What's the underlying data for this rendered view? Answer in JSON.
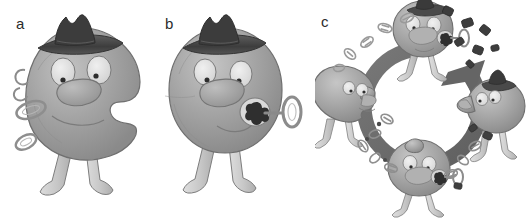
{
  "figure": {
    "background_color": "#ffffff",
    "type": "three-panel cartoon illustration",
    "panels": [
      {
        "id": "a",
        "label": "a",
        "description": "Cartoon blob character wearing a dark fedora hat, with a bite-shaped notch missing from its right side and detached ring and hook fragments floating beside it on the left",
        "character": {
          "has_hat": true,
          "hat_color": "#4a4a4a",
          "body_color": "#9a9a9a",
          "eyes": 2,
          "legs": 2,
          "notch": "right side concave cut",
          "key_attached": false
        },
        "detached_pieces": [
          "hook",
          "ring-large",
          "ring-small"
        ]
      },
      {
        "id": "b",
        "label": "b",
        "description": "Cartoon blob character wearing a dark fedora hat, intact round body with a key-and-ring inserted into a dark keyhole on its right side",
        "character": {
          "has_hat": true,
          "hat_color": "#4a4a4a",
          "body_color": "#9a9a9a",
          "eyes": 2,
          "legs": 2,
          "notch": "none",
          "key_attached": true
        },
        "detached_pieces": []
      },
      {
        "id": "c",
        "label": "c",
        "description": "Cyclic diagram: a thick clockwise circular arrow surrounded by four blob characters in successive states, with small oval debris fragments scattered between them",
        "cycle": {
          "arrow_direction": "clockwise",
          "arrow_color": "#6b6b6b",
          "arrow_gap_position": "top-right",
          "stages": [
            {
              "position": "top",
              "label_hidden": true,
              "has_hat": true,
              "key_attached": true,
              "state": "hatted with key bound"
            },
            {
              "position": "right",
              "label_hidden": true,
              "has_hat": true,
              "key_attached": false,
              "state": "hatted facing left"
            },
            {
              "position": "bottom",
              "label_hidden": true,
              "has_hat": false,
              "key_attached": true,
              "state": "hatless with key bound"
            },
            {
              "position": "left",
              "label_hidden": true,
              "has_hat": false,
              "key_attached": false,
              "state": "hatless facing left, shedding fragments"
            }
          ],
          "debris_groups": [
            {
              "location": "upper-left arc",
              "tone": "light",
              "count": 5
            },
            {
              "location": "upper-right arc",
              "tone": "dark",
              "count": 7
            },
            {
              "location": "lower-left arc",
              "tone": "mixed",
              "count": 7
            },
            {
              "location": "lower-right arc",
              "tone": "mixed",
              "count": 6
            }
          ]
        }
      }
    ],
    "colors": {
      "body_light": "#b9b9b9",
      "body_mid": "#9c9c9c",
      "body_dark": "#7e7e7e",
      "outline": "#6e6e6e",
      "hat_dark": "#3f3f3f",
      "hat_mid": "#5a5a5a",
      "eye_white": "#e6e6e6",
      "arrow": "#6e6e6e",
      "label_text": "#2b2b2b",
      "leg": "#cfcfcf"
    }
  }
}
